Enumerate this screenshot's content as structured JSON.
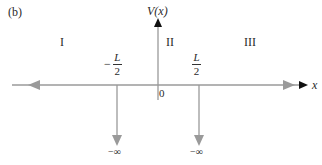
{
  "figure": {
    "panel_label": "(b)",
    "y_axis_label": "V(x)",
    "x_axis_label": "x",
    "origin_label": "0",
    "regions": [
      {
        "id": "I",
        "label": "I"
      },
      {
        "id": "II",
        "label": "II"
      },
      {
        "id": "III",
        "label": "III"
      }
    ],
    "boundaries": [
      {
        "sign": "−",
        "numerator": "L",
        "denominator": "2",
        "value_label": "−∞"
      },
      {
        "sign": "",
        "numerator": "L",
        "denominator": "2",
        "value_label": "−∞"
      }
    ],
    "colors": {
      "axis_gray": "#9a9a9a",
      "arrow_black": "#111111",
      "text": "#2a2a2a"
    }
  }
}
